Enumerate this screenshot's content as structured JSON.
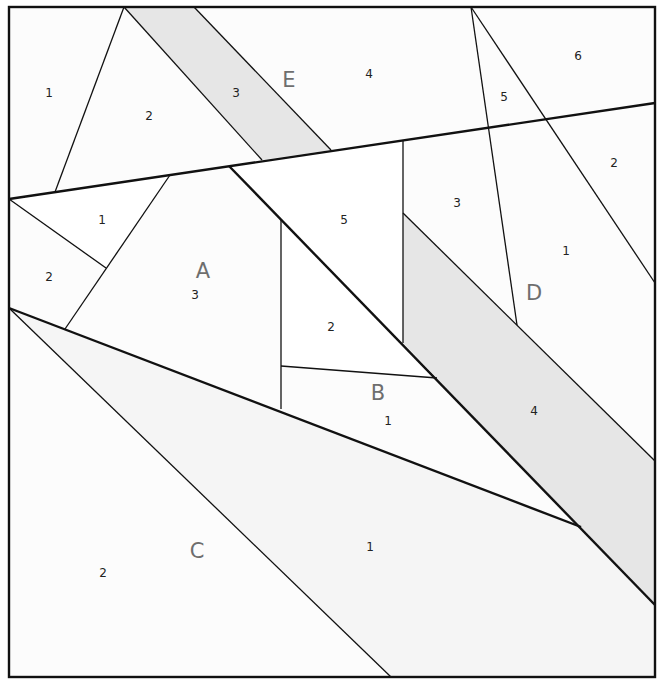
{
  "diagram": {
    "type": "foundation paper piecing pattern",
    "colors": {
      "background": "#fdfdfd",
      "shaded": "#e6e6e6",
      "white_piece": "#ffffff",
      "line": "#111111",
      "section_label": "#6e6e6e"
    },
    "sections": {
      "A": {
        "label": "A",
        "pieces": [
          "1",
          "2",
          "3"
        ]
      },
      "B": {
        "label": "B",
        "pieces": [
          "1",
          "2",
          "3",
          "4",
          "5"
        ]
      },
      "C": {
        "label": "C",
        "pieces": [
          "1",
          "2"
        ]
      },
      "D": {
        "label": "D",
        "pieces": [
          "1",
          "2",
          "3",
          "4",
          "5",
          "6"
        ]
      },
      "E": {
        "label": "E",
        "pieces": [
          "1",
          "2",
          "3",
          "4"
        ]
      }
    },
    "labels": {
      "E1": "1",
      "E2": "2",
      "E3": "3",
      "E4": "4",
      "D5": "5",
      "D6": "6",
      "D2": "2",
      "D3": "3",
      "D1": "1",
      "D4": "4",
      "A1": "1",
      "A2": "2",
      "A3": "3",
      "B5": "5",
      "B2": "2",
      "B1": "1",
      "C1": "1",
      "C2": "2"
    }
  }
}
